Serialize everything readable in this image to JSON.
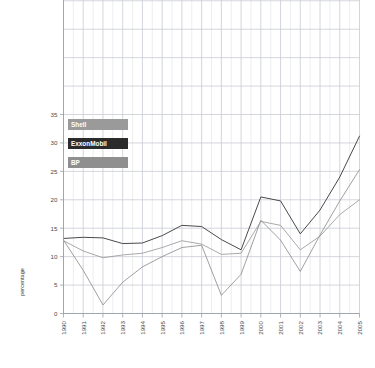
{
  "chart_data": {
    "type": "line",
    "title": "",
    "subtitle": "",
    "xlabel": "",
    "ylabel": "percentage",
    "x": [
      1990,
      1991,
      1992,
      1993,
      1994,
      1995,
      1996,
      1997,
      1998,
      1999,
      2000,
      2001,
      2002,
      2003,
      2004,
      2005
    ],
    "categories": [
      "1990",
      "1991",
      "1992",
      "1993",
      "1994",
      "1995",
      "1996",
      "1997",
      "1998",
      "1999",
      "2000",
      "2001",
      "2002",
      "2003",
      "2004",
      "2005"
    ],
    "xlim": [
      1990,
      2005
    ],
    "ylim": [
      0,
      35
    ],
    "yticks": [
      0,
      5,
      10,
      15,
      20,
      25,
      30,
      35
    ],
    "ytick_labels": [
      "0",
      "5",
      "10",
      "15",
      "20",
      "25",
      "30",
      "35"
    ],
    "grid": true,
    "legend_position": "upper-left",
    "series": [
      {
        "name": "Shell",
        "color": "#9a9a9a",
        "values": [
          12.8,
          11.0,
          9.8,
          10.3,
          10.6,
          11.6,
          12.8,
          12.2,
          10.4,
          10.6,
          16.2,
          15.5,
          11.2,
          13.6,
          17.4,
          20.0
        ]
      },
      {
        "name": "ExxonMobil",
        "color": "#4a4a4a",
        "values": [
          13.2,
          13.4,
          13.3,
          12.3,
          12.4,
          13.7,
          15.5,
          15.3,
          13.0,
          11.2,
          20.5,
          19.8,
          14.0,
          18.2,
          24.0,
          31.2
        ]
      },
      {
        "name": "BP",
        "color": "#8f8f8f",
        "values": [
          12.9,
          7.6,
          1.5,
          5.5,
          8.2,
          10.0,
          11.6,
          12.0,
          3.2,
          6.9,
          16.4,
          12.9,
          7.4,
          13.8,
          19.8,
          25.3
        ]
      }
    ],
    "legend": [
      "Shell",
      "ExxonMobil",
      "BP"
    ]
  },
  "legend": {
    "items": [
      {
        "label": "Shell",
        "color": "#9a9a9a"
      },
      {
        "label": "ExxonMobil",
        "color": "#2b2b2b"
      },
      {
        "label": "BP",
        "color": "#8f8f8f"
      }
    ]
  },
  "axes": {
    "y_title": "percentage",
    "y_ticks": [
      "0",
      "5",
      "10",
      "15",
      "20",
      "25",
      "30",
      "35"
    ],
    "x_ticks": [
      "1990",
      "1991",
      "1992",
      "1993",
      "1994",
      "1995",
      "1996",
      "1997",
      "1998",
      "1999",
      "2000",
      "2001",
      "2002",
      "2003",
      "2004",
      "2005"
    ]
  },
  "colors": {
    "grid": "#c9ccd4",
    "grid_minor": "#e3e5ea",
    "axis": "#9aa0a8",
    "text": "#4a4a4a"
  }
}
